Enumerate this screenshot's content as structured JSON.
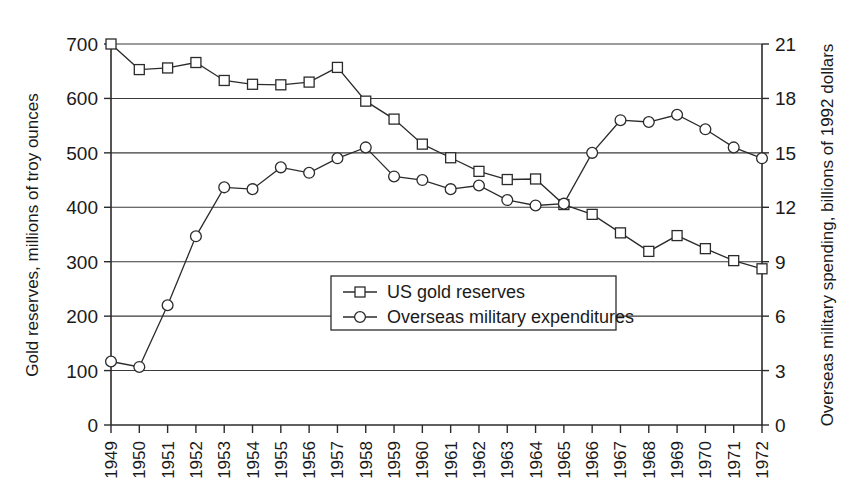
{
  "chart_data": {
    "type": "line",
    "title": "",
    "subtitle": "",
    "xlabel": "",
    "ylabel": "Gold reserves, millions of troy ounces",
    "y2label": "Overseas military spending, billions of 1992 dollars",
    "grid": true,
    "legend_position": "center",
    "x": [
      1949,
      1950,
      1951,
      1952,
      1953,
      1954,
      1955,
      1956,
      1957,
      1958,
      1959,
      1960,
      1961,
      1962,
      1963,
      1964,
      1965,
      1966,
      1967,
      1968,
      1969,
      1970,
      1971,
      1972
    ],
    "categories": [
      "1949",
      "1950",
      "1951",
      "1952",
      "1953",
      "1954",
      "1955",
      "1956",
      "1957",
      "1958",
      "1959",
      "1960",
      "1961",
      "1962",
      "1963",
      "1964",
      "1965",
      "1966",
      "1967",
      "1968",
      "1969",
      "1970",
      "1971",
      "1972"
    ],
    "xlim": [
      1949,
      1972
    ],
    "ylim": [
      0,
      700
    ],
    "y2lim": [
      0,
      21
    ],
    "yticks": [
      0,
      100,
      200,
      300,
      400,
      500,
      600,
      700
    ],
    "y2ticks": [
      0,
      3,
      6,
      9,
      12,
      15,
      18,
      21
    ],
    "ytick_labels": [
      "0",
      "100",
      "200",
      "300",
      "400",
      "500",
      "600",
      "700"
    ],
    "y2tick_labels": [
      "0",
      "3",
      "6",
      "9",
      "12",
      "15",
      "18",
      "21"
    ],
    "series": [
      {
        "name": "US gold reserves",
        "axis": "left",
        "marker": "square",
        "values": [
          700,
          653,
          656,
          666,
          633,
          626,
          625,
          630,
          657,
          595,
          562,
          516,
          491,
          466,
          451,
          452,
          405,
          387,
          353,
          319,
          348,
          324,
          302,
          287
        ]
      },
      {
        "name": "Overseas military expenditures",
        "axis": "right",
        "marker": "circle",
        "values": [
          3.5,
          3.2,
          6.6,
          10.4,
          13.1,
          13.0,
          14.2,
          13.9,
          14.7,
          15.3,
          13.7,
          13.5,
          13.0,
          13.2,
          12.4,
          12.1,
          12.2,
          15.0,
          16.8,
          16.7,
          17.1,
          16.3,
          15.3,
          14.7
        ]
      }
    ],
    "legend": [
      "US gold reserves",
      "Overseas military expenditures"
    ]
  },
  "axes": {
    "left_title": "Gold reserves, millions of troy ounces",
    "right_title": "Overseas military spending, billions of 1992 dollars"
  },
  "legend": {
    "entries": [
      {
        "label": "US gold reserves",
        "marker": "square-marker"
      },
      {
        "label": "Overseas military expenditures",
        "marker": "circle-marker"
      }
    ]
  },
  "colors": {
    "ink": "#1a1a1a",
    "line": "#2b2b2b",
    "grid": "#3a3a3a",
    "background": "#ffffff",
    "marker_fill": "#ffffff"
  }
}
